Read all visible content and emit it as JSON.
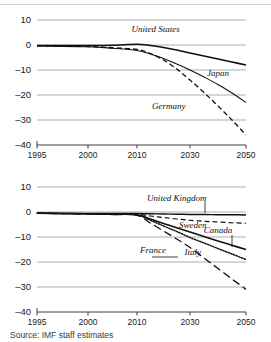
{
  "figure": {
    "source_note": "Source: IMF staff estimates"
  },
  "axes": {
    "y_ticks": [
      10,
      0,
      -10,
      -20,
      -30,
      -40
    ],
    "y_tick_labels": [
      "10",
      "0",
      "–10",
      "–20",
      "–30",
      "–40"
    ],
    "ylim": [
      -40,
      10
    ],
    "x_ticks": [
      1995,
      2000,
      2010,
      2030,
      2050
    ],
    "x_tick_labels": [
      "1995",
      "2000",
      "2010",
      "2030",
      "2050"
    ],
    "xlim": [
      1995,
      2050
    ]
  },
  "chart_data": [
    {
      "type": "line",
      "panel": "top",
      "title": "",
      "xlabel": "",
      "ylabel": "",
      "xlim": [
        1995,
        2050
      ],
      "ylim": [
        -40,
        10
      ],
      "x": [
        1995,
        2000,
        2005,
        2010,
        2015,
        2020,
        2025,
        2030,
        2035,
        2040,
        2045,
        2050
      ],
      "grid": true,
      "legend_position": "inline-annotations",
      "series": [
        {
          "name": "United States",
          "style": "solid",
          "width": 1.6,
          "label_x": 2017,
          "label_y": 5.2,
          "values": [
            -0.2,
            -0.2,
            -0.1,
            0.3,
            -0.2,
            -1.0,
            -2.0,
            -3.2,
            -4.4,
            -5.6,
            -6.8,
            -8.0
          ]
        },
        {
          "name": "Japan",
          "style": "solid",
          "width": 1.1,
          "label_x": 2040,
          "label_y": -12.5,
          "values": [
            -0.4,
            -0.7,
            -1.3,
            -2.2,
            -3.6,
            -5.4,
            -7.6,
            -10.0,
            -12.8,
            -15.8,
            -19.2,
            -23.0
          ]
        },
        {
          "name": "Germany",
          "style": "dashed",
          "width": 1.3,
          "label_x": 2022,
          "label_y": -25.5,
          "values": [
            -0.3,
            -0.6,
            -1.1,
            -1.8,
            -3.4,
            -6.0,
            -9.6,
            -14.0,
            -19.0,
            -24.4,
            -30.0,
            -36.0
          ]
        }
      ]
    },
    {
      "type": "line",
      "panel": "bottom",
      "title": "",
      "xlabel": "",
      "ylabel": "",
      "xlim": [
        1995,
        2050
      ],
      "ylim": [
        -40,
        10
      ],
      "x": [
        1995,
        2000,
        2005,
        2010,
        2015,
        2020,
        2025,
        2030,
        2035,
        2040,
        2045,
        2050
      ],
      "grid": true,
      "legend_position": "inline-annotations",
      "series": [
        {
          "name": "United Kingdom",
          "style": "solid",
          "width": 1.5,
          "label_x": 2025,
          "label_y": 4.6,
          "values": [
            -0.5,
            -0.6,
            -0.6,
            -0.6,
            -0.7,
            -0.8,
            -0.9,
            -1.0,
            -1.0,
            -1.1,
            -1.1,
            -1.2
          ]
        },
        {
          "name": "Sweden",
          "style": "dashed",
          "width": 1.2,
          "label_x": 2031,
          "label_y": -6.2,
          "values": [
            -0.5,
            -0.7,
            -0.8,
            -0.9,
            -1.6,
            -2.2,
            -2.8,
            -3.3,
            -3.7,
            -4.0,
            -4.3,
            -4.5
          ]
        },
        {
          "name": "Canada",
          "style": "solid",
          "width": 1.7,
          "label_x": 2040,
          "label_y": -8.4,
          "values": [
            -0.5,
            -0.7,
            -0.9,
            -1.1,
            -2.8,
            -4.6,
            -6.3,
            -8.0,
            -9.8,
            -11.6,
            -13.3,
            -15.0
          ]
        },
        {
          "name": "Italy",
          "style": "dotted",
          "width": 1.5,
          "label_x": 2031,
          "label_y": -17.0,
          "values": [
            -0.5,
            -0.7,
            -0.9,
            -1.2,
            -3.3,
            -5.6,
            -7.8,
            -10.2,
            -12.4,
            -14.6,
            -16.8,
            -19.0
          ]
        },
        {
          "name": "France",
          "style": "longdash",
          "width": 1.3,
          "label_x": 2016,
          "label_y": -16.2,
          "values": [
            -0.5,
            -0.8,
            -1.0,
            -1.3,
            -4.4,
            -7.6,
            -10.8,
            -14.2,
            -18.4,
            -22.6,
            -26.8,
            -31.0
          ]
        }
      ]
    }
  ]
}
